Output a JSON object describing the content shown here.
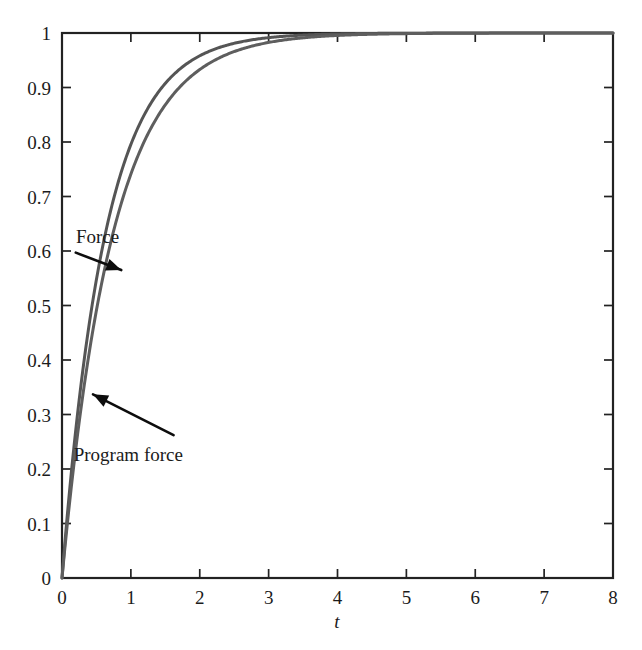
{
  "chart_data": {
    "type": "line",
    "title": "",
    "subtitle": "",
    "xlabel": "t",
    "ylabel": "",
    "xlim": [
      0,
      8
    ],
    "ylim": [
      0,
      1
    ],
    "grid": false,
    "legend_position": "none",
    "background_color": "#ffffff",
    "frame_color": "#222222",
    "xticks": [
      0,
      1,
      2,
      3,
      4,
      5,
      6,
      7,
      8
    ],
    "xtick_labels": [
      "0",
      "1",
      "2",
      "3",
      "4",
      "5",
      "6",
      "7",
      "8"
    ],
    "yticks": [
      0,
      0.1,
      0.2,
      0.3,
      0.4,
      0.5,
      0.6,
      0.7,
      0.8,
      0.9,
      1
    ],
    "ytick_labels": [
      "0",
      "0.1",
      "0.2",
      "0.3",
      "0.4",
      "0.5",
      "0.6",
      "0.7",
      "0.8",
      "0.9",
      "1"
    ],
    "x": [
      0,
      0.1,
      0.2,
      0.3,
      0.4,
      0.5,
      0.6,
      0.7,
      0.8,
      0.9,
      1.0,
      1.2,
      1.4,
      1.6,
      1.8,
      2.0,
      2.25,
      2.5,
      2.75,
      3.0,
      3.25,
      3.5,
      3.75,
      4.0,
      4.5,
      5.0,
      5.5,
      6.0,
      6.5,
      7.0,
      7.5,
      8.0
    ],
    "series": [
      {
        "name": "Force",
        "color": "#555555",
        "linewidth": 3.0,
        "tau": 0.63,
        "values": [
          0,
          0.146,
          0.27,
          0.377,
          0.469,
          0.547,
          0.613,
          0.671,
          0.719,
          0.761,
          0.796,
          0.852,
          0.893,
          0.922,
          0.943,
          0.959,
          0.973,
          0.982,
          0.988,
          0.992,
          0.995,
          0.996,
          0.998,
          0.998,
          0.999,
          1.0,
          1.0,
          1.0,
          1.0,
          1.0,
          1.0,
          1.0
        ]
      },
      {
        "name": "Program force",
        "color": "#5e5e5e",
        "linewidth": 3.0,
        "tau": 0.74,
        "values": [
          0,
          0.126,
          0.237,
          0.333,
          0.417,
          0.49,
          0.555,
          0.611,
          0.661,
          0.704,
          0.741,
          0.803,
          0.851,
          0.886,
          0.913,
          0.933,
          0.952,
          0.966,
          0.976,
          0.983,
          0.988,
          0.991,
          0.994,
          0.996,
          0.998,
          0.999,
          1.0,
          1.0,
          1.0,
          1.0,
          1.0,
          1.0
        ]
      }
    ],
    "annotations": [
      {
        "text": "Force",
        "label_x": 0.22,
        "label_y": 0.625,
        "target_x": 0.86,
        "target_y": 0.565,
        "arrow_from_x": 0.2,
        "arrow_from_y": 0.597
      },
      {
        "text": "Program force",
        "label_x": 0.78,
        "label_y": 0.225,
        "target_x": 0.45,
        "target_y": 0.337,
        "arrow_from_x": 1.62,
        "arrow_from_y": 0.262
      }
    ]
  }
}
